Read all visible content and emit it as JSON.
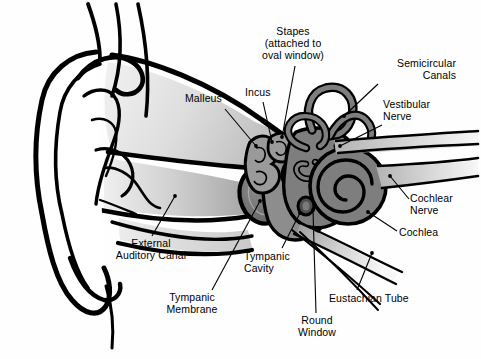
{
  "diagram": {
    "type": "labeled-anatomical-diagram",
    "background_color": "#fefefe",
    "outline_color": "#000000",
    "palette": {
      "outline": "#000000",
      "bone_light": "#d8d8d8",
      "canal_grey": "#b9b9b9",
      "cavity_grey": "#8d8d8d",
      "inner_ear_grey": "#7e7e7e",
      "ossicle_grey": "#9a9a9a",
      "membrane_dark": "#6e6e6e",
      "nerve_light": "#cccccc",
      "white": "#ffffff"
    },
    "labels": [
      {
        "name": "stapes",
        "lines": [
          "Stapes",
          "(attached to",
          "oval window)"
        ],
        "align": "center",
        "x": 249,
        "y": 26,
        "width": 88,
        "leader": {
          "x1": 295,
          "y1": 66,
          "x2": 282,
          "y2": 137
        }
      },
      {
        "name": "semicircular-canals",
        "lines": [
          "Semicircular",
          "Canals"
        ],
        "align": "right",
        "x": 374,
        "y": 58,
        "width": 82,
        "leader": {
          "x1": 378,
          "y1": 84,
          "x2": 344,
          "y2": 116
        }
      },
      {
        "name": "vestibular-nerve",
        "lines": [
          "Vestibular",
          "Nerve"
        ],
        "align": "left",
        "x": 383,
        "y": 99,
        "width": 70,
        "leader": {
          "x1": 382,
          "y1": 125,
          "x2": 340,
          "y2": 146
        }
      },
      {
        "name": "malleus",
        "lines": [
          "Malleus"
        ],
        "align": "left",
        "x": 185,
        "y": 93,
        "width": 48,
        "leader": {
          "x1": 225,
          "y1": 109,
          "x2": 256,
          "y2": 146
        }
      },
      {
        "name": "incus",
        "lines": [
          "Incus"
        ],
        "align": "left",
        "x": 245,
        "y": 87,
        "width": 36,
        "leader": {
          "x1": 263,
          "y1": 102,
          "x2": 272,
          "y2": 142
        }
      },
      {
        "name": "cochlear-nerve",
        "lines": [
          "Cochlear",
          "Nerve"
        ],
        "align": "left",
        "x": 410,
        "y": 193,
        "width": 64,
        "leader": {
          "x1": 409,
          "y1": 199,
          "x2": 390,
          "y2": 176
        }
      },
      {
        "name": "cochlea",
        "lines": [
          "Cochlea"
        ],
        "align": "left",
        "x": 399,
        "y": 227,
        "width": 52,
        "leader": {
          "x1": 397,
          "y1": 231,
          "x2": 368,
          "y2": 212
        }
      },
      {
        "name": "external-auditory-canal",
        "lines": [
          "External",
          "Auditory Canal"
        ],
        "align": "center",
        "x": 102,
        "y": 238,
        "width": 98,
        "leader": {
          "x1": 152,
          "y1": 236,
          "x2": 175,
          "y2": 196
        }
      },
      {
        "name": "tympanic-cavity",
        "lines": [
          "Tympanic",
          "Cavity"
        ],
        "align": "left",
        "x": 244,
        "y": 251,
        "width": 62,
        "leader": {
          "x1": 282,
          "y1": 248,
          "x2": 300,
          "y2": 213
        }
      },
      {
        "name": "tympanic-membrane",
        "lines": [
          "Tympanic",
          "Membrane"
        ],
        "align": "center",
        "x": 157,
        "y": 292,
        "width": 70,
        "leader": {
          "x1": 212,
          "y1": 290,
          "x2": 260,
          "y2": 201
        }
      },
      {
        "name": "eustachian-tube",
        "lines": [
          "Eustachian Tube"
        ],
        "align": "left",
        "x": 329,
        "y": 293,
        "width": 94,
        "leader": {
          "x1": 357,
          "y1": 290,
          "x2": 372,
          "y2": 253
        }
      },
      {
        "name": "round-window",
        "lines": [
          "Round",
          "Window"
        ],
        "align": "center",
        "x": 289,
        "y": 315,
        "width": 56,
        "leader": {
          "x1": 316,
          "y1": 313,
          "x2": 313,
          "y2": 210
        }
      }
    ],
    "structures": [
      {
        "name": "pinna-auricle",
        "label_ref": null
      },
      {
        "name": "external-auditory-canal",
        "label_ref": "external-auditory-canal"
      },
      {
        "name": "tympanic-membrane",
        "label_ref": "tympanic-membrane"
      },
      {
        "name": "tympanic-cavity",
        "label_ref": "tympanic-cavity"
      },
      {
        "name": "malleus",
        "label_ref": "malleus"
      },
      {
        "name": "incus",
        "label_ref": "incus"
      },
      {
        "name": "stapes",
        "label_ref": "stapes"
      },
      {
        "name": "semicircular-canals",
        "label_ref": "semicircular-canals"
      },
      {
        "name": "vestibular-nerve",
        "label_ref": "vestibular-nerve"
      },
      {
        "name": "cochlea",
        "label_ref": "cochlea"
      },
      {
        "name": "cochlear-nerve",
        "label_ref": "cochlear-nerve"
      },
      {
        "name": "round-window",
        "label_ref": "round-window"
      },
      {
        "name": "eustachian-tube",
        "label_ref": "eustachian-tube"
      }
    ]
  }
}
